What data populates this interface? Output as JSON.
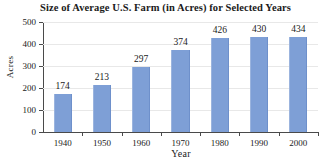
{
  "chart_data": {
    "type": "bar",
    "title": "Size of Average U.S. Farm (in Acres) for Selected Years",
    "xlabel": "Year",
    "ylabel": "Acres",
    "categories": [
      "1940",
      "1950",
      "1960",
      "1970",
      "1980",
      "1990",
      "2000"
    ],
    "values": [
      174,
      213,
      297,
      374,
      426,
      430,
      434
    ],
    "value_labels": [
      "174",
      "213",
      "297",
      "374",
      "426",
      "430",
      "434"
    ],
    "ylim": [
      0,
      500
    ],
    "yticks": [
      0,
      100,
      200,
      300,
      400,
      500
    ],
    "ytick_labels": [
      "0",
      "100",
      "200",
      "300",
      "400",
      "500"
    ],
    "grid": true,
    "grid_axis": "y",
    "legend": false,
    "bar_color": "#7e9fd6",
    "axis_color": "#4a4a4a",
    "grid_color": "#e8e8e8",
    "background_color": "#ffffff"
  }
}
